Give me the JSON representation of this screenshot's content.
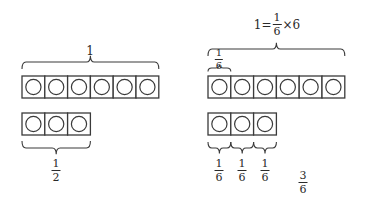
{
  "colors": {
    "stroke": "#3a3a3a",
    "text": "#2a2a2a",
    "background": "#ffffff"
  },
  "left": {
    "whole_row": {
      "cells": 6,
      "x": 22,
      "y": 76,
      "cell_w": 22.8,
      "cell_h": 22
    },
    "whole_label": "1",
    "part_row": {
      "cells": 3,
      "x": 22,
      "y": 113,
      "cell_w": 22.8,
      "cell_h": 22
    },
    "part_label": {
      "num": "1",
      "den": "2"
    }
  },
  "right": {
    "equation": {
      "lhs": "1=",
      "num": "1",
      "den": "6",
      "rhs": "×6"
    },
    "whole_row": {
      "cells": 6,
      "x": 208,
      "y": 76,
      "cell_w": 22.8,
      "cell_h": 22
    },
    "unit_label": {
      "num": "1",
      "den": "6"
    },
    "part_row": {
      "cells": 3,
      "x": 208,
      "y": 113,
      "cell_w": 22.8,
      "cell_h": 22
    },
    "part_labels": [
      {
        "num": "1",
        "den": "6"
      },
      {
        "num": "1",
        "den": "6"
      },
      {
        "num": "1",
        "den": "6"
      }
    ],
    "total_label": {
      "num": "3",
      "den": "6"
    }
  }
}
